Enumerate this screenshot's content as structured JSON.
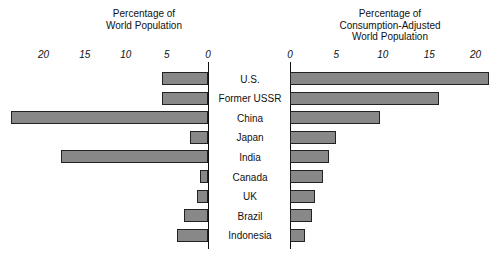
{
  "chart_data": {
    "type": "bar",
    "title": "",
    "orientation": "horizontal",
    "layout": "butterfly-diverging-pair",
    "categories": [
      "U.S.",
      "Former USSR",
      "China",
      "Japan",
      "India",
      "Canada",
      "UK",
      "Brazil",
      "Indonesia"
    ],
    "panels": [
      {
        "id": "left",
        "title": "Percentage of\nWorld Population",
        "xlabel": "",
        "ylabel": "",
        "direction": "right-to-left",
        "xlim": [
          0,
          22
        ],
        "ticks": [
          20,
          15,
          10,
          5,
          0
        ],
        "tick_labels": [
          "20",
          "15",
          "10",
          "5",
          "0"
        ],
        "grid": false,
        "values": [
          5.6,
          5.6,
          24.0,
          2.2,
          17.9,
          1.0,
          1.3,
          2.9,
          3.8
        ]
      },
      {
        "id": "right",
        "title": "Percentage of\nConsumption-Adjusted\nWorld Population",
        "xlabel": "",
        "ylabel": "",
        "direction": "left-to-right",
        "xlim": [
          0,
          22
        ],
        "ticks": [
          0,
          5,
          10,
          15,
          20
        ],
        "tick_labels": [
          "0",
          "5",
          "10",
          "15",
          "20"
        ],
        "grid": false,
        "values": [
          21.4,
          16.1,
          9.7,
          5.0,
          4.2,
          3.6,
          2.7,
          2.4,
          1.6
        ]
      }
    ],
    "series": [
      {
        "name": "Percentage of World Population",
        "values": [
          5.6,
          5.6,
          24.0,
          2.2,
          17.9,
          1.0,
          1.3,
          2.9,
          3.8
        ]
      },
      {
        "name": "Percentage of Consumption-Adjusted World Population",
        "values": [
          21.4,
          16.1,
          9.7,
          5.0,
          4.2,
          3.6,
          2.7,
          2.4,
          1.6
        ]
      }
    ],
    "legend": null,
    "colors": {
      "bar_fill": "#888888",
      "bar_stroke": "#222222",
      "axis": "#111111",
      "background": "#ffffff"
    }
  },
  "left_panel": {
    "title_line1": "Percentage of",
    "title_line2": "World Population",
    "ticks": [
      {
        "label": "20",
        "value": 20
      },
      {
        "label": "15",
        "value": 15
      },
      {
        "label": "10",
        "value": 10
      },
      {
        "label": "5",
        "value": 5
      },
      {
        "label": "0",
        "value": 0
      }
    ]
  },
  "right_panel": {
    "title_line1": "Percentage of",
    "title_line2": "Consumption-Adjusted",
    "title_line3": "World Population",
    "ticks": [
      {
        "label": "0",
        "value": 0
      },
      {
        "label": "5",
        "value": 5
      },
      {
        "label": "10",
        "value": 10
      },
      {
        "label": "15",
        "value": 15
      },
      {
        "label": "20",
        "value": 20
      }
    ]
  },
  "rows": [
    {
      "label": "U.S.",
      "left": 5.6,
      "right": 21.4
    },
    {
      "label": "Former USSR",
      "left": 5.6,
      "right": 16.1
    },
    {
      "label": "China",
      "left": 24.0,
      "right": 9.7
    },
    {
      "label": "Japan",
      "left": 2.2,
      "right": 5.0
    },
    {
      "label": "India",
      "left": 17.9,
      "right": 4.2
    },
    {
      "label": "Canada",
      "left": 1.0,
      "right": 3.6
    },
    {
      "label": "UK",
      "left": 1.3,
      "right": 2.7
    },
    {
      "label": "Brazil",
      "left": 2.9,
      "right": 2.4
    },
    {
      "label": "Indonesia",
      "left": 3.8,
      "right": 1.6
    }
  ]
}
